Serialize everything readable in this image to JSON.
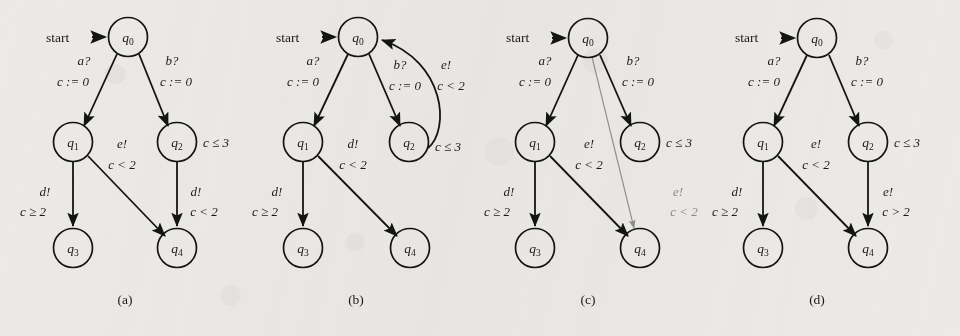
{
  "figure": {
    "background_color": "#eceae7",
    "ink_color": "#141414",
    "faint_ink_color": "#8e8e8e",
    "start_label": "start",
    "panel_count": 4
  },
  "panels": [
    {
      "caption": "(a)",
      "states": [
        {
          "id": "q0",
          "base": "q",
          "sub": "0"
        },
        {
          "id": "q1",
          "base": "q",
          "sub": "1"
        },
        {
          "id": "q2",
          "base": "q",
          "sub": "2"
        },
        {
          "id": "q3",
          "base": "q",
          "sub": "3"
        },
        {
          "id": "q4",
          "base": "q",
          "sub": "4"
        }
      ],
      "invariants": [
        {
          "state": "q2",
          "text": "c ≤ 3"
        }
      ],
      "edges": [
        {
          "from": "q0",
          "to": "q1",
          "action": "a?",
          "guard": "c := 0",
          "style": "solid"
        },
        {
          "from": "q0",
          "to": "q2",
          "action": "b?",
          "guard": "c := 0",
          "style": "solid"
        },
        {
          "from": "q1",
          "to": "q3",
          "action": "d!",
          "guard": "c ≥ 2",
          "style": "solid"
        },
        {
          "from": "q1",
          "to": "q4",
          "action": "e!",
          "guard": "c < 2",
          "style": "solid"
        },
        {
          "from": "q2",
          "to": "q4",
          "action": "d!",
          "guard": "c < 2",
          "style": "solid"
        }
      ]
    },
    {
      "caption": "(b)",
      "states": [
        {
          "id": "q0",
          "base": "q",
          "sub": "0"
        },
        {
          "id": "q1",
          "base": "q",
          "sub": "1"
        },
        {
          "id": "q2",
          "base": "q",
          "sub": "2"
        },
        {
          "id": "q3",
          "base": "q",
          "sub": "3"
        },
        {
          "id": "q4",
          "base": "q",
          "sub": "4"
        }
      ],
      "invariants": [
        {
          "state": "q2",
          "text": "c ≤ 3"
        }
      ],
      "edges": [
        {
          "from": "q0",
          "to": "q1",
          "action": "a?",
          "guard": "c := 0",
          "style": "solid"
        },
        {
          "from": "q0",
          "to": "q2",
          "action": "b?",
          "guard": "c := 0",
          "style": "solid"
        },
        {
          "from": "q1",
          "to": "q3",
          "action": "d!",
          "guard": "c ≥ 2",
          "style": "solid"
        },
        {
          "from": "q1",
          "to": "q4",
          "action": "d!",
          "guard": "c < 2",
          "style": "solid"
        },
        {
          "from": "q2",
          "to": "q0",
          "action": "e!",
          "guard": "c < 2",
          "style": "curved"
        }
      ]
    },
    {
      "caption": "(c)",
      "states": [
        {
          "id": "q0",
          "base": "q",
          "sub": "0"
        },
        {
          "id": "q1",
          "base": "q",
          "sub": "1"
        },
        {
          "id": "q2",
          "base": "q",
          "sub": "2"
        },
        {
          "id": "q3",
          "base": "q",
          "sub": "3"
        },
        {
          "id": "q4",
          "base": "q",
          "sub": "4"
        }
      ],
      "invariants": [
        {
          "state": "q2",
          "text": "c ≤ 3"
        }
      ],
      "edges": [
        {
          "from": "q0",
          "to": "q1",
          "action": "a?",
          "guard": "c := 0",
          "style": "solid"
        },
        {
          "from": "q0",
          "to": "q2",
          "action": "b?",
          "guard": "c := 0",
          "style": "solid"
        },
        {
          "from": "q1",
          "to": "q3",
          "action": "d!",
          "guard": "c ≥ 2",
          "style": "solid"
        },
        {
          "from": "q1",
          "to": "q4",
          "action": "e!",
          "guard": "c < 2",
          "style": "solid"
        },
        {
          "from": "q0",
          "to": "q4",
          "action": "e!",
          "guard": "c < 2",
          "style": "faint"
        }
      ]
    },
    {
      "caption": "(d)",
      "states": [
        {
          "id": "q0",
          "base": "q",
          "sub": "0"
        },
        {
          "id": "q1",
          "base": "q",
          "sub": "1"
        },
        {
          "id": "q2",
          "base": "q",
          "sub": "2"
        },
        {
          "id": "q3",
          "base": "q",
          "sub": "3"
        },
        {
          "id": "q4",
          "base": "q",
          "sub": "4"
        }
      ],
      "invariants": [
        {
          "state": "q2",
          "text": "c ≤ 3"
        }
      ],
      "edges": [
        {
          "from": "q0",
          "to": "q1",
          "action": "a?",
          "guard": "c := 0",
          "style": "solid"
        },
        {
          "from": "q0",
          "to": "q2",
          "action": "b?",
          "guard": "c := 0",
          "style": "solid"
        },
        {
          "from": "q1",
          "to": "q3",
          "action": "d!",
          "guard": "c ≥ 2",
          "style": "solid"
        },
        {
          "from": "q1",
          "to": "q4",
          "action": "e!",
          "guard": "c < 2",
          "style": "solid"
        },
        {
          "from": "q2",
          "to": "q4",
          "action": "e!",
          "guard": "c > 2",
          "style": "solid"
        }
      ]
    }
  ]
}
